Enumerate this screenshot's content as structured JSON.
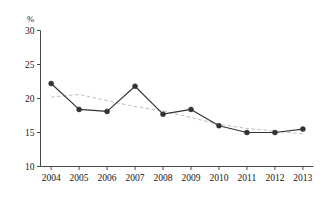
{
  "chart_data": {
    "type": "line",
    "title": "",
    "subtitle": "",
    "xlabel": "",
    "ylabel": "",
    "unit_label": "%",
    "categories": [
      "2004",
      "2005",
      "2006",
      "2007",
      "2008",
      "2009",
      "2010",
      "2011",
      "2012",
      "2013"
    ],
    "x": [
      2004,
      2005,
      2006,
      2007,
      2008,
      2009,
      2010,
      2011,
      2012,
      2013
    ],
    "series": [
      {
        "name": "data",
        "style": "solid-with-markers",
        "color": "#333333",
        "marker": "circle",
        "values": [
          22.2,
          18.4,
          18.1,
          21.8,
          17.7,
          18.4,
          16.0,
          15.0,
          15.0,
          15.5
        ]
      },
      {
        "name": "trendline",
        "style": "dashed",
        "color": "#bdbdbd",
        "marker": "none",
        "values": [
          20.2,
          20.6,
          19.7,
          18.8,
          18.2,
          17.2,
          16.2,
          15.6,
          15.2,
          14.8
        ]
      }
    ],
    "ylim": [
      10,
      30
    ],
    "yticks": [
      10,
      15,
      20,
      25,
      30
    ],
    "yticklabels": [
      "10",
      "15",
      "20",
      "25",
      "30"
    ],
    "xlim": [
      2003.5,
      2013.5
    ],
    "grid": false,
    "legend": false,
    "legend_position": "none"
  },
  "colors": {
    "axis": "#4a4a4a",
    "series_line": "#333333",
    "series_marker": "#2b2b2b",
    "trendline": "#c2c2c2",
    "background": "#ffffff",
    "text": "#151515"
  },
  "axes": {
    "y_unit": "%",
    "y_min_label": "10",
    "y_max_label": "30",
    "x_first_label": "2004",
    "x_last_label": "2013"
  }
}
